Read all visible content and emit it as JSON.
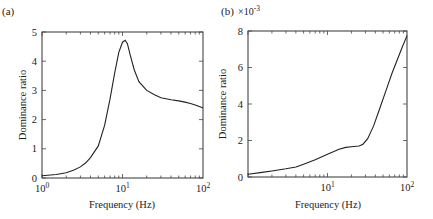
{
  "chart_data": [
    {
      "type": "line",
      "panel_label": "(a)",
      "title": "",
      "xlabel": "Frequency (Hz)",
      "ylabel": "Dominance ratio",
      "xscale": "log",
      "xlim": [
        1,
        100
      ],
      "ylim": [
        0,
        5
      ],
      "xtick_labels": [
        "10^0",
        "10^1",
        "10^2"
      ],
      "ytick_labels": [
        "0",
        "1",
        "2",
        "3",
        "4",
        "5"
      ],
      "grid": false,
      "series": [
        {
          "name": "dominance ratio",
          "x": [
            1.0,
            1.5,
            2.0,
            2.5,
            3.0,
            3.5,
            4.0,
            5.0,
            6.0,
            7.0,
            8.0,
            9.0,
            10.0,
            10.8,
            11.5,
            12.5,
            14.0,
            16.0,
            20.0,
            25.0,
            30.0,
            40.0,
            50.0,
            60.0,
            70.0,
            80.0,
            90.0,
            100.0
          ],
          "y": [
            0.08,
            0.12,
            0.18,
            0.27,
            0.38,
            0.52,
            0.7,
            1.1,
            1.8,
            2.7,
            3.6,
            4.3,
            4.65,
            4.72,
            4.6,
            4.2,
            3.7,
            3.3,
            3.0,
            2.85,
            2.75,
            2.68,
            2.64,
            2.6,
            2.55,
            2.5,
            2.45,
            2.4
          ]
        }
      ]
    },
    {
      "type": "line",
      "panel_label": "(b)",
      "title": "",
      "xlabel": "Frequency (Hz)",
      "ylabel": "Dominance ratio",
      "y_multiplier": "×10^-3",
      "xscale": "log",
      "xlim": [
        1,
        100
      ],
      "ylim": [
        0,
        8
      ],
      "xtick_labels": [
        "10^1",
        "10^2"
      ],
      "ytick_labels": [
        "0",
        "2",
        "4",
        "6",
        "8"
      ],
      "grid": false,
      "series": [
        {
          "name": "dominance ratio (×10^-3)",
          "x": [
            1.0,
            1.5,
            2.0,
            3.0,
            4.0,
            5.0,
            7.0,
            10.0,
            14.0,
            17.0,
            20.0,
            25.0,
            28.0,
            32.0,
            38.0,
            45.0,
            55.0,
            65.0,
            75.0,
            85.0,
            100.0
          ],
          "y": [
            0.15,
            0.25,
            0.33,
            0.45,
            0.55,
            0.7,
            0.95,
            1.25,
            1.52,
            1.62,
            1.66,
            1.7,
            1.8,
            2.1,
            2.8,
            3.7,
            4.8,
            5.7,
            6.4,
            7.0,
            7.75
          ]
        }
      ]
    }
  ]
}
